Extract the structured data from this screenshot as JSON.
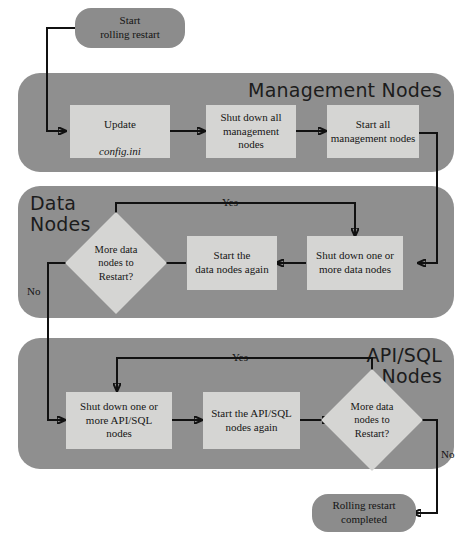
{
  "diagram": {
    "colors": {
      "panel_bg": "#8f8f8f",
      "process_bg": "#d5d5d3",
      "terminal_bg": "#8c8c8c",
      "line": "#111111",
      "page_bg": "#ffffff"
    }
  },
  "terminals": {
    "start": "Start\nrolling restart",
    "end": "Rolling restart\ncompleted"
  },
  "panels": [
    {
      "id": "management",
      "title": "Management Nodes"
    },
    {
      "id": "data",
      "title": "Data\nNodes"
    },
    {
      "id": "apisql",
      "title": "API/SQL\nNodes"
    }
  ],
  "management": {
    "steps": [
      {
        "line1": "Update",
        "line2": "config.ini"
      },
      {
        "text": "Shut down all\nmanagement nodes"
      },
      {
        "text": "Start all\nmanagement nodes"
      }
    ]
  },
  "data_nodes": {
    "shutdown": "Shut down one or\nmore data nodes",
    "start": "Start the\ndata nodes again",
    "decision": "More data\nnodes to\nRestart?",
    "yes_label": "Yes",
    "no_label": "No"
  },
  "api_sql_nodes": {
    "shutdown": "Shut down one or\nmore API/SQL\nnodes",
    "start": "Start the API/SQL\nnodes again",
    "decision": "More data\nnodes to\nRestart?",
    "yes_label": "Yes",
    "no_label": "No"
  }
}
